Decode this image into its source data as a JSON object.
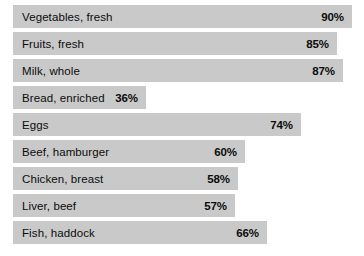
{
  "chart_data": {
    "type": "bar",
    "orientation": "horizontal",
    "title": "",
    "xlabel": "",
    "ylabel": "",
    "xlim": [
      0,
      95
    ],
    "grid": false,
    "legend": null,
    "value_suffix": "%",
    "bar_color": "#c9c9c9",
    "background_color": "#ffffff",
    "text_color": "#0c0c0c",
    "categories": [
      "Vegetables, fresh",
      "Fruits, fresh",
      "Milk, whole",
      "Bread, enriched",
      "Eggs",
      "Beef, hamburger",
      "Chicken, breast",
      "Liver, beef",
      "Fish, haddock"
    ],
    "values": [
      90,
      85,
      87,
      36,
      74,
      60,
      58,
      57,
      66
    ],
    "value_labels": [
      "90%",
      "85%",
      "87%",
      "36%",
      "74%",
      "60%",
      "58%",
      "57%",
      "66%"
    ],
    "bars": [
      {
        "label": "Vegetables, fresh",
        "value": 90,
        "value_label": "90%",
        "width_px": 339
      },
      {
        "label": "Fruits, fresh",
        "value": 85,
        "value_label": "85%",
        "width_px": 324
      },
      {
        "label": "Milk, whole",
        "value": 87,
        "value_label": "87%",
        "width_px": 330
      },
      {
        "label": "Bread, enriched",
        "value": 36,
        "value_label": "36%",
        "width_px": 133
      },
      {
        "label": "Eggs",
        "value": 74,
        "value_label": "74%",
        "width_px": 288
      },
      {
        "label": "Beef, hamburger",
        "value": 60,
        "value_label": "60%",
        "width_px": 232
      },
      {
        "label": "Chicken, breast",
        "value": 58,
        "value_label": "58%",
        "width_px": 225
      },
      {
        "label": "Liver, beef",
        "value": 57,
        "value_label": "57%",
        "width_px": 222
      },
      {
        "label": "Fish, haddock",
        "value": 66,
        "value_label": "66%",
        "width_px": 254
      }
    ]
  }
}
